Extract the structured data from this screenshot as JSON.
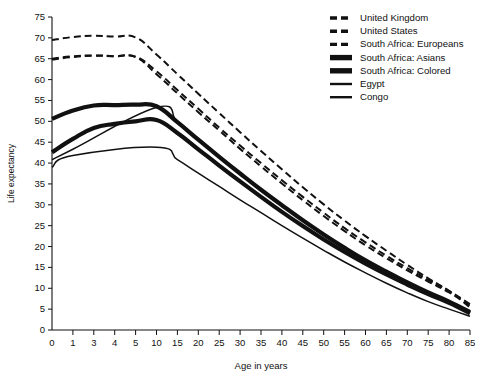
{
  "chart_data": {
    "type": "line",
    "title": "",
    "xlabel": "Age in years",
    "ylabel": "Life expectancy",
    "grid": false,
    "legend_position": "top-right",
    "x_scale": "ordinal-nonlinear",
    "x_tick_labels": [
      "0",
      "1",
      "3",
      "4",
      "5",
      "10",
      "15",
      "20",
      "25",
      "30",
      "35",
      "40",
      "45",
      "50",
      "55",
      "60",
      "65",
      "70",
      "75",
      "80",
      "85"
    ],
    "x": [
      0,
      1,
      3,
      4,
      5,
      10,
      15,
      20,
      25,
      30,
      35,
      40,
      45,
      50,
      55,
      60,
      65,
      70,
      75,
      80,
      85
    ],
    "ylim": [
      0,
      75
    ],
    "y_tick_labels": [
      "0",
      "5",
      "10",
      "15",
      "20",
      "25",
      "30",
      "35",
      "40",
      "45",
      "50",
      "55",
      "60",
      "65",
      "70",
      "75"
    ],
    "y_ticks": [
      0,
      5,
      10,
      15,
      20,
      25,
      30,
      35,
      40,
      45,
      50,
      55,
      60,
      65,
      70,
      75
    ],
    "series": [
      {
        "name": "United Kingdom",
        "style": "dashed",
        "width": 2.0,
        "color": "#111111",
        "values": [
          69.5,
          70.2,
          70.5,
          70.3,
          70.1,
          66.0,
          61.3,
          56.6,
          52.0,
          47.4,
          42.9,
          38.5,
          34.2,
          30.1,
          26.2,
          22.5,
          19.0,
          15.6,
          12.4,
          9.4,
          6.2
        ]
      },
      {
        "name": "United States",
        "style": "dashed",
        "width": 2.0,
        "color": "#111111",
        "values": [
          65.0,
          65.6,
          65.8,
          65.6,
          65.4,
          61.3,
          56.7,
          52.2,
          47.8,
          43.4,
          39.2,
          35.1,
          31.1,
          27.3,
          23.7,
          20.3,
          17.2,
          14.3,
          11.6,
          9.0,
          5.8
        ]
      },
      {
        "name": "South Africa: Europeans",
        "style": "dashed",
        "width": 2.0,
        "color": "#111111",
        "values": [
          64.8,
          65.4,
          65.7,
          65.6,
          65.5,
          62.0,
          57.5,
          53.0,
          48.5,
          44.2,
          40.0,
          35.9,
          31.9,
          28.1,
          24.4,
          21.0,
          17.8,
          14.8,
          12.0,
          9.3,
          5.4
        ]
      },
      {
        "name": "South Africa: Asians",
        "style": "solid",
        "width": 4.2,
        "color": "#111111",
        "values": [
          50.6,
          52.6,
          53.8,
          53.9,
          54.0,
          53.6,
          49.8,
          45.6,
          41.5,
          37.5,
          33.6,
          29.9,
          26.3,
          22.9,
          19.7,
          16.7,
          14.0,
          11.4,
          9.0,
          6.8,
          4.3
        ]
      },
      {
        "name": "South Africa: Colored",
        "style": "solid",
        "width": 4.2,
        "color": "#111111",
        "values": [
          42.6,
          45.8,
          48.4,
          49.4,
          50.0,
          50.3,
          47.2,
          43.3,
          39.4,
          35.6,
          31.9,
          28.3,
          24.9,
          21.7,
          18.7,
          15.9,
          13.3,
          10.9,
          8.6,
          6.5,
          4.0
        ]
      },
      {
        "name": "Egypt",
        "style": "solid",
        "width": 1.5,
        "color": "#111111",
        "values": [
          40.8,
          43.3,
          null,
          null,
          null,
          53.3,
          49.8,
          45.8,
          41.7,
          37.6,
          33.7,
          29.9,
          26.3,
          22.8,
          19.6,
          16.6,
          13.9,
          11.3,
          8.9,
          6.7,
          4.6
        ]
      },
      {
        "name": "Congo",
        "style": "solid",
        "width": 1.5,
        "color": "#111111",
        "values": [
          39.0,
          41.8,
          null,
          null,
          null,
          43.8,
          40.8,
          37.6,
          34.4,
          31.2,
          28.1,
          25.0,
          22.0,
          19.1,
          16.3,
          13.7,
          11.2,
          8.9,
          6.8,
          5.0,
          3.3
        ]
      }
    ]
  },
  "legend": {
    "entries": [
      {
        "label": "United Kingdom",
        "style": "dashed"
      },
      {
        "label": "United States",
        "style": "dashed"
      },
      {
        "label": "South Africa: Europeans",
        "style": "dashed"
      },
      {
        "label": "South Africa: Asians",
        "style": "thick"
      },
      {
        "label": "South Africa: Colored",
        "style": "thick"
      },
      {
        "label": "Egypt",
        "style": "thin"
      },
      {
        "label": "Congo",
        "style": "thin"
      }
    ]
  },
  "colors": {
    "ink": "#111111",
    "background": "#ffffff"
  }
}
